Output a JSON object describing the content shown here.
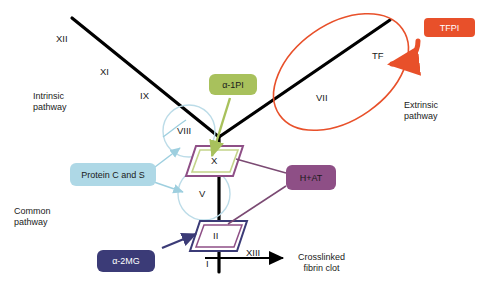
{
  "diagram": {
    "pathways": {
      "intrinsic": "Intrinsic\npathway",
      "extrinsic": "Extrinsic\npathway",
      "common": "Common\npathway"
    },
    "factors": {
      "xii": "XII",
      "xi": "XI",
      "ix": "IX",
      "viii": "VIII",
      "x": "X",
      "v": "V",
      "ii": "II",
      "i": "I",
      "xiii": "XIII",
      "vii": "VII",
      "tf": "TF"
    },
    "inhibitors": {
      "a1pi": "α-1PI",
      "tfpi": "TFPI",
      "protein_cs": "Protein C and S",
      "hat": "H+AT",
      "a2mg": "α-2MG"
    },
    "outcome": "Crosslinked\nfibrin clot",
    "colors": {
      "a1pi": "#a8c15c",
      "tfpi": "#e8502a",
      "protein_cs": "#aed8e6",
      "hat": "#8e4f86",
      "a2mg": "#3b3b77",
      "cascade_line": "#000000",
      "ellipse": "#e8502a",
      "circle": "#bcdce8",
      "x_outer": "#8e4f86",
      "x_inner": "#a8c15c",
      "ii_outer": "#3b3b77",
      "ii_inner": "#8e4f86"
    }
  }
}
